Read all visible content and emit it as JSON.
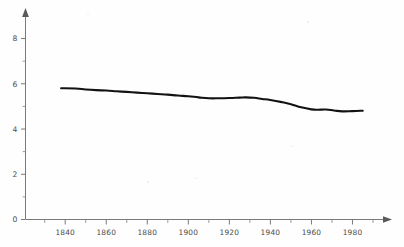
{
  "chart_data": {
    "type": "line",
    "title": "",
    "subtitle": "",
    "xlabel": "",
    "ylabel": "",
    "xlim": [
      1825,
      1997
    ],
    "ylim": [
      0,
      8.8
    ],
    "grid": false,
    "legend": null,
    "x_ticks": [
      1840,
      1860,
      1880,
      1900,
      1920,
      1940,
      1960,
      1980
    ],
    "x_tick_labels": [
      "1840",
      "1860",
      "1880",
      "1900",
      "1920",
      "1940",
      "1960",
      "1980"
    ],
    "x_minor_ticks": [
      1830,
      1850,
      1870,
      1890,
      1910,
      1930,
      1950,
      1970,
      1990
    ],
    "y_ticks": [
      0,
      2,
      4,
      6,
      8
    ],
    "y_tick_labels": [
      "0",
      "2",
      "4",
      "6",
      "8"
    ],
    "y_minor_ticks": [
      1,
      3,
      5,
      7
    ],
    "series": [
      {
        "name": "series-1",
        "color": "#121212",
        "x": [
          1838,
          1845,
          1850,
          1855,
          1860,
          1865,
          1870,
          1875,
          1880,
          1885,
          1890,
          1895,
          1900,
          1905,
          1910,
          1915,
          1920,
          1925,
          1928,
          1932,
          1936,
          1940,
          1945,
          1950,
          1955,
          1960,
          1963,
          1967,
          1971,
          1975,
          1980,
          1985
        ],
        "y": [
          5.8,
          5.79,
          5.75,
          5.72,
          5.7,
          5.67,
          5.64,
          5.61,
          5.58,
          5.55,
          5.52,
          5.48,
          5.45,
          5.4,
          5.36,
          5.36,
          5.37,
          5.39,
          5.4,
          5.38,
          5.33,
          5.28,
          5.2,
          5.1,
          4.96,
          4.87,
          4.85,
          4.86,
          4.82,
          4.78,
          4.79,
          4.81
        ]
      }
    ]
  },
  "axes": {
    "x_axis_name": "x-axis",
    "y_axis_name": "y-axis",
    "arrow_x_label": "x-axis-arrow",
    "arrow_y_label": "y-axis-arrow"
  }
}
